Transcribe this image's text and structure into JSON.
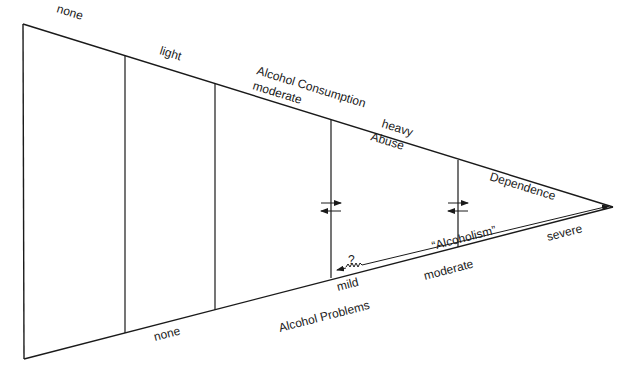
{
  "diagram": {
    "top_axis": {
      "title": "Alcohol Consumption",
      "levels": [
        "none",
        "light",
        "moderate",
        "heavy"
      ]
    },
    "bottom_axis": {
      "title": "Alcohol Problems",
      "levels": [
        "none",
        "mild",
        "moderate",
        "severe"
      ]
    },
    "regions": {
      "abuse": "Abuse",
      "dependence": "Dependence"
    },
    "alcoholism_label": "“Alcoholism”",
    "uncertainty_mark": "?",
    "colors": {
      "line": "#1a1a1a",
      "background": "#ffffff"
    }
  }
}
